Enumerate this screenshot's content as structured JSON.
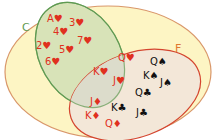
{
  "diagram": {
    "type": "venn",
    "colors": {
      "universe_fill": "#fdf5c4",
      "universe_stroke": "#d9976a",
      "set_c_fill": "#d8e3b8",
      "set_c_stroke": "#5f9a52",
      "set_f_fill": "#f3e7d8",
      "set_f_stroke": "#d4452f",
      "overlap_fill": "#dcdccb",
      "red_text": "#e0301e",
      "black_text": "#111111"
    },
    "sets": {
      "c": {
        "label": "C",
        "label_color": "#5f9a52"
      },
      "f": {
        "label": "F",
        "label_color": "#e07830"
      }
    },
    "c_only": [
      "A♥",
      "3♥",
      "4♥",
      "2♥",
      "7♥",
      "5♥",
      "6♥"
    ],
    "c_and_f": [
      "Q♥",
      "K♥",
      "J♥"
    ],
    "f_only": [
      "Q♠",
      "K♠",
      "J♠",
      "Q♣",
      "J♦",
      "K♣",
      "J♣",
      "K♦",
      "Q♦"
    ]
  }
}
